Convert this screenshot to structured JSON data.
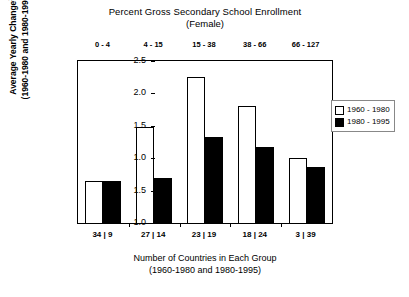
{
  "chart_data": {
    "type": "bar",
    "title": "Percent Gross Secondary School Enrollment",
    "subtitle": "(Female)",
    "categories": [
      "0 - 4",
      "4 - 15",
      "15 - 38",
      "38 - 66",
      "66 - 127"
    ],
    "series": [
      {
        "name": "1960 - 1980",
        "fill": "#ffffff",
        "values": [
          0.65,
          1.48,
          2.25,
          1.8,
          1.0
        ]
      },
      {
        "name": "1980 - 1995",
        "fill": "#000000",
        "values": [
          0.65,
          0.7,
          1.33,
          1.18,
          0.87
        ]
      }
    ],
    "ylabel_line1": "Average Yearly Change",
    "ylabel_note": "1",
    "ylabel_line2": "(1960-1980 and 1980-1995)",
    "yticks": [
      "2.5",
      "2.0",
      "1.5",
      "1.0",
      "1.5",
      "1.0"
    ],
    "ytick_values": [
      2.5,
      2.0,
      1.5,
      1.0,
      0.5,
      0.0
    ],
    "ylim": [
      0.0,
      2.5
    ],
    "xlabel_line1": "Number of Countries in Each Group",
    "xlabel_line2": "(1960-1980 and 1980-1995)",
    "xtick_labels": [
      "34 | 9",
      "27 | 14",
      "23 | 19",
      "18 | 24",
      "3 | 39"
    ],
    "grid": false,
    "legend_position": "right",
    "axis_color": "#000000"
  },
  "legend": {
    "items": [
      {
        "label": "1960 - 1980",
        "style": "light"
      },
      {
        "label": "1980 - 1995",
        "style": "dark"
      }
    ]
  }
}
